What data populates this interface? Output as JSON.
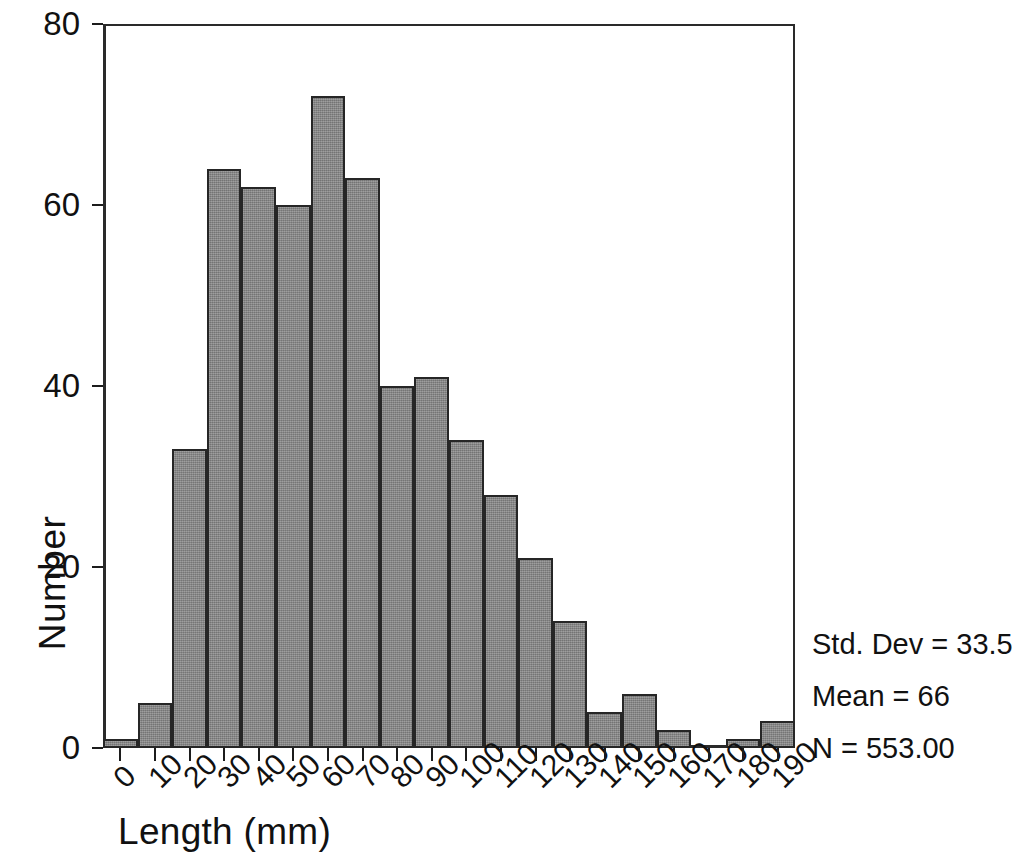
{
  "chart_data": {
    "type": "bar",
    "title": "",
    "xlabel": "Length (mm)",
    "ylabel": "Number",
    "xlim": [
      0,
      200
    ],
    "ylim": [
      0,
      80
    ],
    "bin_width": 10,
    "grid": false,
    "legend": "none",
    "bar_color": "#8a8a8a",
    "bar_edge_color": "#262626",
    "axis_color": "#2a2a2a",
    "xtick_labels": [
      "0",
      "10",
      "20",
      "30",
      "40",
      "50",
      "60",
      "70",
      "80",
      "90",
      "100",
      "110",
      "120",
      "130",
      "140",
      "150",
      "160",
      "170",
      "180",
      "190"
    ],
    "xtick_rotation_deg": -45,
    "ytick_labels": [
      "0",
      "20",
      "40",
      "60",
      "80"
    ],
    "ytick_values": [
      0,
      20,
      40,
      60,
      80
    ],
    "categories": [
      "0",
      "10",
      "20",
      "30",
      "40",
      "50",
      "60",
      "70",
      "80",
      "90",
      "100",
      "110",
      "120",
      "130",
      "140",
      "150",
      "160",
      "170",
      "180",
      "190"
    ],
    "values": [
      1,
      5,
      33,
      64,
      62,
      60,
      72,
      63,
      40,
      41,
      34,
      28,
      21,
      14,
      4,
      6,
      2,
      0,
      1,
      3
    ]
  },
  "annotations": {
    "std_dev": "Std. Dev = 33.53",
    "mean": "Mean = 66",
    "n": "N = 553.00"
  }
}
